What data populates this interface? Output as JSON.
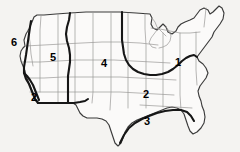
{
  "figure": {
    "name": "united-states-zone-map",
    "background_color": "#f4f3f1",
    "land_fill": "#fbfaf9",
    "outline_color": "#3a3a3a",
    "state_border_color": "#9a9896",
    "zone_boundary_color": "#161616",
    "width": 240,
    "height": 152
  },
  "zone_labels": [
    {
      "id": "zone-label-6",
      "text": "6",
      "x": 14,
      "y": 42,
      "region": "pacific-northwest-coast"
    },
    {
      "id": "zone-label-5",
      "text": "5",
      "x": 53,
      "y": 57,
      "region": "intermountain-west"
    },
    {
      "id": "zone-label-4",
      "text": "4",
      "x": 104,
      "y": 63,
      "region": "great-plains"
    },
    {
      "id": "zone-label-1",
      "text": "1",
      "x": 178,
      "y": 62,
      "region": "northeast-midwest"
    },
    {
      "id": "zone-label-2-south",
      "text": "2",
      "x": 146,
      "y": 94,
      "region": "southeast"
    },
    {
      "id": "zone-label-2-west",
      "text": "2",
      "x": 34,
      "y": 97,
      "region": "southern-california"
    },
    {
      "id": "zone-label-3",
      "text": "3",
      "x": 147,
      "y": 121,
      "region": "gulf-coast"
    }
  ],
  "zone_count": 6
}
